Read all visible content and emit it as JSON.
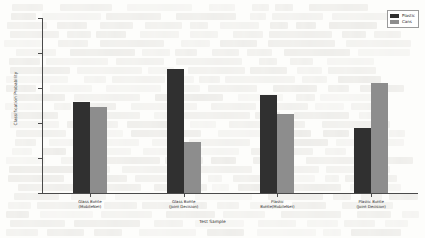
{
  "chart_data": {
    "type": "bar",
    "title": "",
    "xlabel": "Test Sample",
    "ylabel": "Classification Probability",
    "ylim": [
      0,
      100
    ],
    "yticks": [
      0,
      20,
      40,
      60,
      80,
      100
    ],
    "grid": false,
    "legend_position": "top-right",
    "categories": [
      "Glass Bottle\n(MobileNet)",
      "Glass Bottle\n(Joint Decision)",
      "Plastic\nBottle(MobileNet)",
      "Plastic Bottle\n(Joint Decision)"
    ],
    "series": [
      {
        "name": "Plastic",
        "color": "#303030",
        "values": [
          52,
          71,
          56,
          37
        ]
      },
      {
        "name": "Cans",
        "color": "#8d8d8d",
        "values": [
          49,
          29,
          45,
          63
        ]
      }
    ]
  }
}
